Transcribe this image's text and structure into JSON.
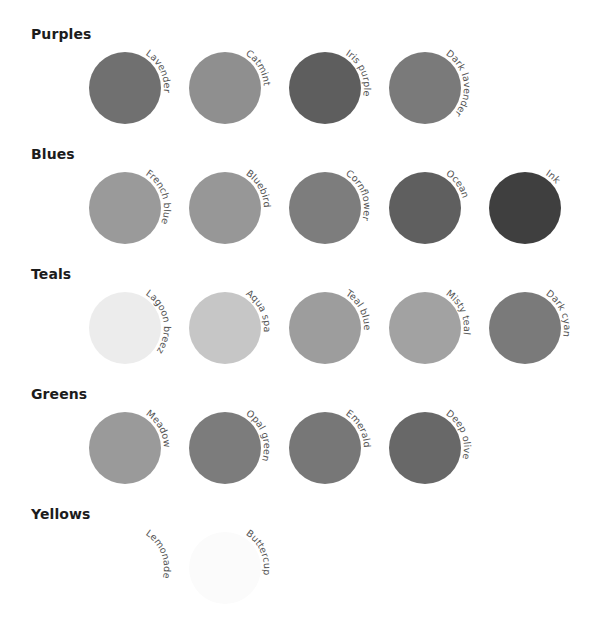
{
  "groups": [
    {
      "title": "Purples",
      "swatches": [
        {
          "name": "Lavender",
          "color": "#707070"
        },
        {
          "name": "Catmint",
          "color": "#8f8f8f"
        },
        {
          "name": "Iris purple",
          "color": "#5e5e5e"
        },
        {
          "name": "Dark lavender",
          "color": "#7a7a7a"
        }
      ]
    },
    {
      "title": "Blues",
      "swatches": [
        {
          "name": "French blue",
          "color": "#9a9a9a"
        },
        {
          "name": "Bluebird",
          "color": "#979797"
        },
        {
          "name": "Cornflower",
          "color": "#7d7d7d"
        },
        {
          "name": "Ocean",
          "color": "#5f5f5f"
        },
        {
          "name": "Ink",
          "color": "#3f3f3f"
        }
      ]
    },
    {
      "title": "Teals",
      "swatches": [
        {
          "name": "Lagoon breeze",
          "color": "#ececec"
        },
        {
          "name": "Aqua spa",
          "color": "#c6c6c6"
        },
        {
          "name": "Teal blue",
          "color": "#9d9d9d"
        },
        {
          "name": "Misty teal",
          "color": "#a2a2a2"
        },
        {
          "name": "Dark cyan",
          "color": "#7a7a7a"
        }
      ]
    },
    {
      "title": "Greens",
      "swatches": [
        {
          "name": "Meadow",
          "color": "#9a9a9a"
        },
        {
          "name": "Opal green",
          "color": "#7c7c7c"
        },
        {
          "name": "Emerald",
          "color": "#777777"
        },
        {
          "name": "Deep olive",
          "color": "#686868"
        }
      ]
    },
    {
      "title": "Yellows",
      "swatches": [
        {
          "name": "Lemonade",
          "color": "#ffffff"
        },
        {
          "name": "Buttercup",
          "color": "#fbfbfb"
        }
      ]
    }
  ]
}
